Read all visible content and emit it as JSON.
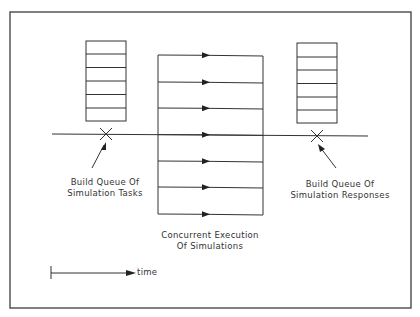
{
  "diagram": {
    "frame": {
      "x": 10,
      "y": 12,
      "width": 401,
      "height": 296
    },
    "stroke_color": "#222222",
    "left_queue": {
      "x": 86,
      "y": 41,
      "width": 40,
      "height": 80,
      "slots": 6,
      "label_line1": "Build Queue Of",
      "label_line2": "Simulation Tasks"
    },
    "right_queue": {
      "x": 297,
      "y": 43,
      "width": 40,
      "height": 80,
      "slots": 6,
      "label_line1": "Build Queue Of",
      "label_line2": "Simulation Responses"
    },
    "concurrent_block": {
      "x": 158,
      "y": 55,
      "width": 105,
      "height": 159,
      "lanes": 7,
      "label_line1": "Concurrent Execution",
      "label_line2": "Of Simulations"
    },
    "timeline": {
      "y": 134,
      "x_start": 52,
      "x_end": 368
    },
    "markers": [
      {
        "name": "start-marker",
        "x": 106,
        "y": 134
      },
      {
        "name": "end-marker",
        "x": 317,
        "y": 136
      }
    ],
    "time_legend": {
      "label": "time"
    }
  }
}
